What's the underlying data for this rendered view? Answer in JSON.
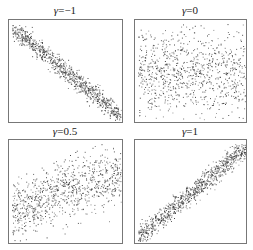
{
  "chart_data": [
    {
      "type": "scatter",
      "title": "γ=−1",
      "gamma_symbol": "γ",
      "gamma_value": "=−1",
      "correlation": -1,
      "description": "Strong negative linear relation: dense band from top-left to bottom-right",
      "xlim": [
        0,
        1
      ],
      "ylim": [
        0,
        1
      ],
      "n_points": 900,
      "band_sd": 0.055,
      "trend": {
        "x0": 0.0,
        "y0": 0.95,
        "x1": 1.0,
        "y1": 0.05
      },
      "xlabel": "",
      "ylabel": "",
      "grid": false,
      "ticks": false
    },
    {
      "type": "scatter",
      "title": "γ=0",
      "gamma_symbol": "γ",
      "gamma_value": "=0",
      "correlation": 0,
      "description": "No relation: points spread broadly, denser around middle height",
      "xlim": [
        0,
        1
      ],
      "ylim": [
        0,
        1
      ],
      "n_points": 900,
      "band_sd": 0.2,
      "trend": {
        "x0": 0.0,
        "y0": 0.5,
        "x1": 1.0,
        "y1": 0.5
      },
      "xlabel": "",
      "ylabel": "",
      "grid": false,
      "ticks": false
    },
    {
      "type": "scatter",
      "title": "γ=0.5",
      "gamma_symbol": "γ",
      "gamma_value": "=0.5",
      "correlation": 0.5,
      "description": "Moderate positive relation: wide band rising left to right",
      "xlim": [
        0,
        1
      ],
      "ylim": [
        0,
        1
      ],
      "n_points": 900,
      "band_sd": 0.15,
      "trend": {
        "x0": 0.0,
        "y0": 0.3,
        "x1": 1.0,
        "y1": 0.72
      },
      "xlabel": "",
      "ylabel": "",
      "grid": false,
      "ticks": false
    },
    {
      "type": "scatter",
      "title": "γ=1",
      "gamma_symbol": "γ",
      "gamma_value": "=1",
      "correlation": 1,
      "description": "Strong positive linear relation: dense band from bottom-left to top-right",
      "xlim": [
        0,
        1
      ],
      "ylim": [
        0,
        1
      ],
      "n_points": 900,
      "band_sd": 0.055,
      "trend": {
        "x0": 0.0,
        "y0": 0.05,
        "x1": 1.0,
        "y1": 0.95
      },
      "xlabel": "",
      "ylabel": "",
      "grid": false,
      "ticks": false
    }
  ],
  "style": {
    "point_color": "#333333",
    "border_color": "#777777"
  }
}
